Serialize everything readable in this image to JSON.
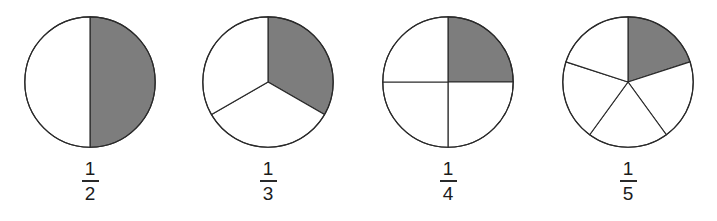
{
  "figure": {
    "background_color": "#ffffff",
    "stroke_color": "#2a2a2a",
    "shaded_color": "#7d7d7d",
    "unshaded_color": "#ffffff"
  },
  "chart_data": {
    "type": "pie",
    "xlabel": "",
    "ylabel": "",
    "legend": "none",
    "grid": false,
    "charts": [
      {
        "label": "1/2",
        "numerator": "1",
        "denominator": "2",
        "total_sectors": 2,
        "shaded_sectors": 1,
        "sector_angle_deg": 180,
        "start_angle_deg": 0,
        "values": [
          0.5,
          0.5
        ],
        "categories": [
          "shaded",
          "unshaded"
        ]
      },
      {
        "label": "1/3",
        "numerator": "1",
        "denominator": "3",
        "total_sectors": 3,
        "shaded_sectors": 1,
        "sector_angle_deg": 120,
        "start_angle_deg": 0,
        "values": [
          0.3333,
          0.3333,
          0.3333
        ],
        "categories": [
          "shaded",
          "unshaded",
          "unshaded"
        ]
      },
      {
        "label": "1/4",
        "numerator": "1",
        "denominator": "4",
        "total_sectors": 4,
        "shaded_sectors": 1,
        "sector_angle_deg": 90,
        "start_angle_deg": 0,
        "values": [
          0.25,
          0.25,
          0.25,
          0.25
        ],
        "categories": [
          "shaded",
          "unshaded",
          "unshaded",
          "unshaded"
        ]
      },
      {
        "label": "1/5",
        "numerator": "1",
        "denominator": "5",
        "total_sectors": 5,
        "shaded_sectors": 1,
        "sector_angle_deg": 72,
        "start_angle_deg": 0,
        "values": [
          0.2,
          0.2,
          0.2,
          0.2,
          0.2
        ],
        "categories": [
          "shaded",
          "unshaded",
          "unshaded",
          "unshaded",
          "unshaded"
        ]
      }
    ]
  }
}
